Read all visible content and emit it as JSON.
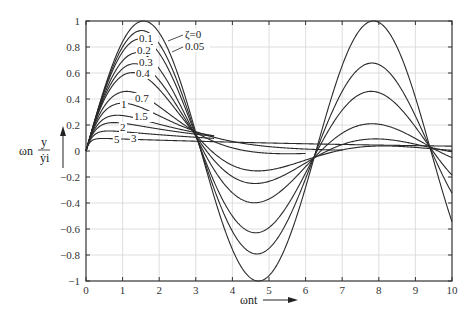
{
  "chart_data": {
    "type": "line",
    "xlabel": "ωnt",
    "ylabel": "ωn y / ẏi",
    "xlim": [
      0,
      10
    ],
    "ylim": [
      -1,
      1
    ],
    "x_ticks": [
      "0",
      "1",
      "2",
      "3",
      "4",
      "5",
      "6",
      "7",
      "8",
      "9",
      "10"
    ],
    "y_ticks": [
      "1",
      "0.8",
      "0.6",
      "0.4",
      "0.2",
      "0",
      "-0.2",
      "-0.4",
      "-0.6",
      "-0.8",
      "-1"
    ],
    "grid": true,
    "legend_position": "inline labels",
    "series": [
      {
        "name": "ζ=0",
        "zeta": 0,
        "x_end": 10,
        "peak": 1.0,
        "peak_x": 1.57
      },
      {
        "name": "0.05",
        "zeta": 0.05,
        "x_end": 10,
        "peak": 0.93,
        "peak_x": 1.54
      },
      {
        "name": "0.1",
        "zeta": 0.1,
        "x_end": 10,
        "peak": 0.86,
        "peak_x": 1.47
      },
      {
        "name": "0.2",
        "zeta": 0.2,
        "x_end": 10,
        "peak": 0.75,
        "peak_x": 1.37
      },
      {
        "name": "0.3",
        "zeta": 0.3,
        "x_end": 10,
        "peak": 0.65,
        "peak_x": 1.27
      },
      {
        "name": "0.4",
        "zeta": 0.4,
        "x_end": 10,
        "peak": 0.56,
        "peak_x": 1.19
      },
      {
        "name": "0.7",
        "zeta": 0.7,
        "x_end": 6,
        "peak": 0.46,
        "peak_x": 1.09
      },
      {
        "name": "1",
        "zeta": 1.0,
        "x_end": 7,
        "peak": 0.37,
        "peak_x": 1.0
      },
      {
        "name": "1.5",
        "zeta": 1.5,
        "x_end": 3.5,
        "peak": 0.26,
        "peak_x": 0.86
      },
      {
        "name": "2",
        "zeta": 2.0,
        "x_end": 3.5,
        "peak": 0.2,
        "peak_x": 0.76
      },
      {
        "name": "3",
        "zeta": 3.0,
        "x_end": 3.5,
        "peak": 0.13,
        "peak_x": 0.62
      },
      {
        "name": "5",
        "zeta": 5.0,
        "x_end": 10,
        "peak": 0.08,
        "peak_x": 0.46
      }
    ]
  },
  "labels": {
    "y_axis_main": "ωn",
    "y_axis_num": "y",
    "y_axis_den": "ẏi",
    "x_axis": "ωnt"
  }
}
